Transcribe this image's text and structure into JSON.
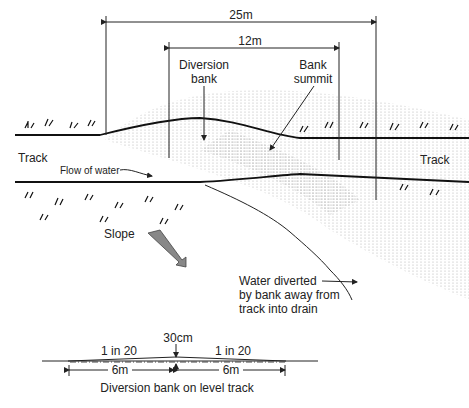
{
  "diagram": {
    "dimensions": {
      "outer_width": "25m",
      "inner_width": "12m"
    },
    "labels": {
      "diversion_bank": [
        "Diversion",
        "bank"
      ],
      "bank_summit": [
        "Bank",
        "summit"
      ],
      "track_left": "Track",
      "track_right": "Track",
      "flow_of_water": "Flow of water",
      "slope": "Slope",
      "water_diverted": [
        "Water diverted",
        "by bank away from",
        "track into drain"
      ]
    },
    "cross_section": {
      "height": "30cm",
      "gradient_left": "1 in 20",
      "gradient_right": "1 in 20",
      "half_width_left": "6m",
      "half_width_right": "6m",
      "caption": "Diversion bank on level track"
    }
  }
}
